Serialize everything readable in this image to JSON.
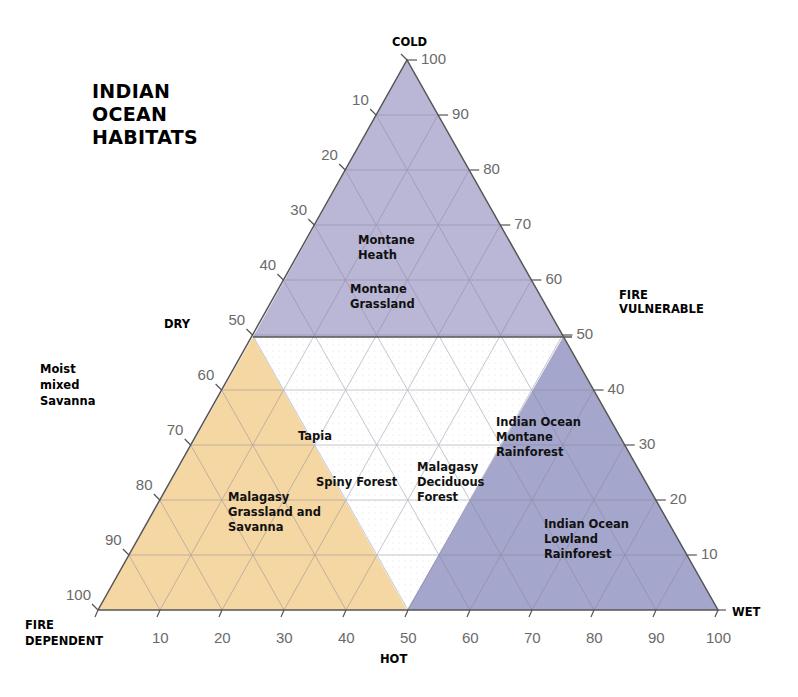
{
  "title": "INDIAN\nOCEAN\nHABITATS",
  "corner_labels": {
    "cold": "COLD",
    "dry": "DRY",
    "moist_mixed_savanna": "Moist\nmixed\nSavanna",
    "fire_vulnerable": "FIRE\nVULNERABLE",
    "fire_dependent": "FIRE\nDEPENDENT",
    "hot": "HOT",
    "wet": "WET"
  },
  "regions": {
    "montane_heath": "Montane\nHeath",
    "montane_grassland": "Montane\nGrassland",
    "tapia": "Tapia",
    "spiny_forest": "Spiny Forest",
    "malagasy_deciduous_forest": "Malagasy\nDeciduous\nForest",
    "malagasy_grassland_savanna": "Malagasy\nGrassland and\nSavanna",
    "io_montane_rainforest": "Indian Ocean\nMontane\nRainforest",
    "io_lowland_rainforest": "Indian Ocean\nLowland\nRainforest"
  },
  "ticks": {
    "left": [
      "10",
      "20",
      "30",
      "40",
      "50",
      "60",
      "70",
      "80",
      "90",
      "100"
    ],
    "right": [
      "100",
      "90",
      "80",
      "70",
      "60",
      "50",
      "40",
      "30",
      "20",
      "10"
    ],
    "bottom": [
      "10",
      "20",
      "30",
      "40",
      "50",
      "60",
      "70",
      "80",
      "90",
      "100"
    ]
  },
  "colors": {
    "purple": "#b6b3d4",
    "blue": "#a5a6cc",
    "tan": "#f5d7a4",
    "grid": "#8a8aa0",
    "edge": "#555555"
  },
  "chart_data": {
    "type": "ternary",
    "title": "INDIAN OCEAN HABITATS",
    "axes": {
      "left_edge": {
        "label_top": "DRY",
        "range": [
          0,
          100
        ],
        "ticks": [
          10,
          20,
          30,
          40,
          50,
          60,
          70,
          80,
          90,
          100
        ]
      },
      "right_edge": {
        "label": "FIRE VULNERABLE",
        "range": [
          100,
          0
        ],
        "ticks": [
          100,
          90,
          80,
          70,
          60,
          50,
          40,
          30,
          20,
          10
        ]
      },
      "bottom_edge": {
        "label": "HOT",
        "range": [
          0,
          100
        ],
        "ticks": [
          10,
          20,
          30,
          40,
          50,
          60,
          70,
          80,
          90,
          100
        ]
      }
    },
    "vertices": {
      "top": "COLD",
      "bottom_left": "FIRE DEPENDENT",
      "bottom_right": "WET"
    },
    "zones": [
      {
        "name": "Montane (upper half, purple)",
        "vertical_range": [
          50,
          100
        ],
        "labels": [
          "Montane Heath",
          "Montane Grassland"
        ]
      },
      {
        "name": "Fire dependent (tan)",
        "labels": [
          "Tapia",
          "Malagasy Grassland and Savanna"
        ]
      },
      {
        "name": "Central (white)",
        "labels": [
          "Spiny Forest",
          "Malagasy Deciduous Forest"
        ]
      },
      {
        "name": "Rainforest (blue)",
        "labels": [
          "Indian Ocean Montane Rainforest",
          "Indian Ocean Lowland Rainforest"
        ]
      }
    ],
    "grid": true
  }
}
